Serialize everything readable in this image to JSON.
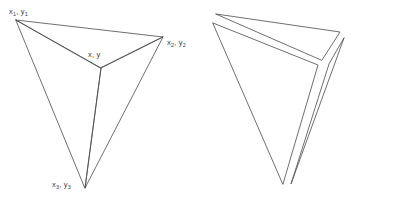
{
  "diagram": {
    "stroke_color": "#4a4a4a",
    "background_color": "#ffffff",
    "stroke_width": 0.8,
    "labels": {
      "vertex1": {
        "base": "x",
        "sub": "1",
        "base2": "y",
        "sub2": "1",
        "text": "x1, y1"
      },
      "vertex2": {
        "base": "x",
        "sub": "2",
        "base2": "y",
        "sub2": "2",
        "text": "x2, y2"
      },
      "vertex3": {
        "base": "x",
        "sub": "3",
        "base2": "y",
        "sub2": "3",
        "text": "x3, y3"
      },
      "interior": {
        "text": "x, y"
      }
    },
    "left_figure": {
      "name": "joined-triangle",
      "vertices": {
        "v1": [
          16,
          20
        ],
        "v2": [
          163,
          37
        ],
        "v3": [
          85,
          188
        ],
        "center": [
          101,
          68
        ]
      },
      "sub_triangles": [
        {
          "name": "upper-triangle",
          "points": "16,20 163,37 101,68"
        },
        {
          "name": "right-triangle",
          "points": "163,37 85,188 101,68"
        },
        {
          "name": "left-triangle",
          "points": "16,20 101,68 85,188"
        }
      ]
    },
    "right_figure": {
      "name": "exploded-triangle",
      "sub_triangles": [
        {
          "name": "upper-triangle-exploded",
          "points": "216,14 340,32 322,60"
        },
        {
          "name": "right-triangle-exploded",
          "points": "344,38 291,184 329,64"
        },
        {
          "name": "left-triangle-exploded",
          "points": "213,23 318,65 283,184"
        }
      ]
    }
  }
}
